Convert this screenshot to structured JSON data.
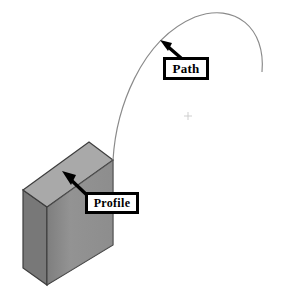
{
  "diagram": {
    "type": "isometric-cad-illustration",
    "background_color": "#ffffff",
    "callouts": [
      {
        "id": "path",
        "label": "Path",
        "box": {
          "x": 163,
          "y": 57,
          "width": 46,
          "height": 23
        },
        "border_color": "#000000",
        "fill_color": "#ffffff",
        "arrow": {
          "from_x": 181,
          "from_y": 58,
          "to_x": 161,
          "to_y": 41
        }
      },
      {
        "id": "profile",
        "label": "Profile",
        "box": {
          "x": 85,
          "y": 192,
          "width": 54,
          "height": 22
        },
        "border_color": "#000000",
        "fill_color": "#ffffff",
        "arrow": {
          "from_x": 88,
          "from_y": 196,
          "to_x": 63,
          "to_y": 172
        }
      }
    ],
    "block": {
      "name": "profile-block",
      "top_face_color": "#a9a9a9",
      "front_face_color": "#8f8f8f",
      "side_face_color": "#787878",
      "edge_color": "#3a3a3a",
      "vertices": {
        "top_back_left": {
          "x": 23,
          "y": 190
        },
        "top_back_right": {
          "x": 89,
          "y": 142
        },
        "top_front_right": {
          "x": 113,
          "y": 160
        },
        "top_front_left": {
          "x": 47,
          "y": 207
        },
        "bottom_front_left": {
          "x": 47,
          "y": 285
        },
        "bottom_front_right": {
          "x": 113,
          "y": 245
        },
        "bottom_back_left": {
          "x": 23,
          "y": 268
        }
      }
    },
    "path_curve": {
      "name": "sweep-path",
      "color": "#8a8a8a",
      "stroke_width": 1,
      "start": {
        "x": 113,
        "y": 160
      },
      "apex": {
        "x": 218,
        "y": 13
      },
      "end": {
        "x": 262,
        "y": 72
      }
    },
    "marker": {
      "name": "center-crosshair",
      "x": 188,
      "y": 116,
      "size": 7,
      "color": "#c8c8c8"
    }
  }
}
